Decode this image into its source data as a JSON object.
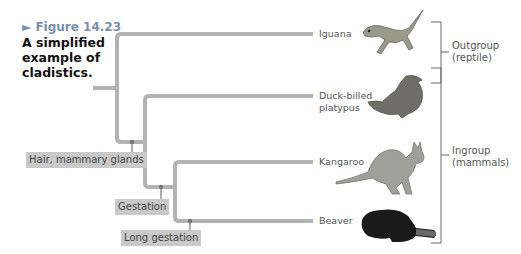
{
  "figure": {
    "label": "► Figure 14.23",
    "title": "A simplified example of cladistics."
  },
  "taxa": [
    {
      "name": "Iguana",
      "icon": "iguana-illustration"
    },
    {
      "name": "Duck-billed platypus",
      "icon": "platypus-illustration"
    },
    {
      "name": "Kangaroo",
      "icon": "kangaroo-illustration"
    },
    {
      "name": "Beaver",
      "icon": "beaver-illustration"
    }
  ],
  "traits": [
    {
      "label": "Hair, mammary glands"
    },
    {
      "label": "Gestation"
    },
    {
      "label": "Long gestation"
    }
  ],
  "groups": [
    {
      "label": "Outgroup",
      "sublabel": "(reptile)"
    },
    {
      "label": "Ingroup",
      "sublabel": "(mammals)"
    }
  ],
  "colors": {
    "branch": "#b3b3b3",
    "trait_box": "#c9c9c9",
    "figure_label": "#7a8fae"
  }
}
